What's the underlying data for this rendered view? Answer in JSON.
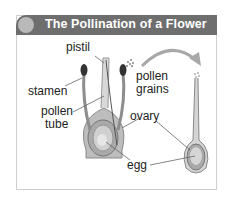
{
  "diagram": {
    "title": "The Pollination of a Flower",
    "labels": {
      "pistil": "pistil",
      "stamen": "stamen",
      "pollen_tube_line1": "pollen",
      "pollen_tube_line2": "tube",
      "pollen_grains_line1": "pollen",
      "pollen_grains_line2": "grains",
      "ovary": "ovary",
      "egg": "egg"
    },
    "colors": {
      "title_bar": "#6e6e6e",
      "title_dot": "#b9b9b9",
      "title_text": "#ffffff",
      "arrow": "#a8a8a8"
    }
  }
}
